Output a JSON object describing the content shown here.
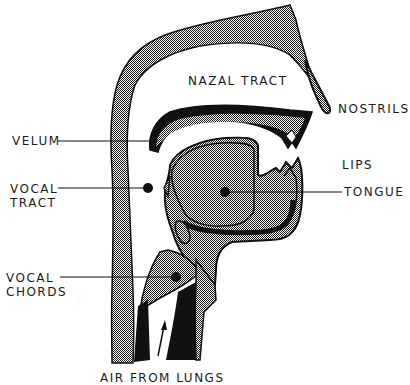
{
  "diagram": {
    "colors": {
      "ink": "#111111",
      "background": "#ffffff",
      "tissue_pattern": "checkered grey"
    },
    "labels": {
      "nazal_tract": "NAZAL TRACT",
      "nostrils": "NOSTRILS",
      "velum": "VELUM",
      "lips": "LIPS",
      "vocal_tract_line1": "VOCAL",
      "vocal_tract_line2": "TRACT",
      "tongue": "TONGUE",
      "vocal_chords_line1": "VOCAL",
      "vocal_chords_line2": "CHORDS",
      "air_from_lungs": "AIR FROM LUNGS"
    }
  }
}
